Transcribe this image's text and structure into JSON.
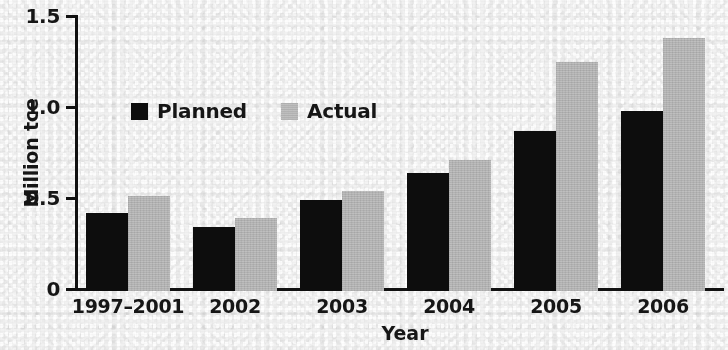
{
  "chart_data": {
    "type": "bar",
    "title": "",
    "xlabel": "Year",
    "ylabel": "Million tce",
    "ylim": [
      0,
      1.5
    ],
    "yticks": [
      0,
      0.5,
      1.0,
      1.5
    ],
    "ytick_labels": [
      "0",
      "0.5",
      "1.0",
      "1.5"
    ],
    "grid": false,
    "legend_position": "upper-left-inside",
    "categories": [
      "1997–2001",
      "2002",
      "2003",
      "2004",
      "2005",
      "2006"
    ],
    "series": [
      {
        "name": "Planned",
        "color": "#0d0d0d",
        "values": [
          0.43,
          0.35,
          0.5,
          0.65,
          0.88,
          0.99
        ]
      },
      {
        "name": "Actual",
        "color": "#b9b9b9",
        "values": [
          0.52,
          0.4,
          0.55,
          0.72,
          1.26,
          1.39
        ]
      }
    ]
  },
  "axes": {
    "y_title": "Million tce",
    "x_title": "Year",
    "y_tick_0": "0",
    "y_tick_1": "0.5",
    "y_tick_2": "1.0",
    "y_tick_3": "1.5"
  },
  "legend": {
    "entries": [
      {
        "label": "Planned",
        "swatch": "black-square-icon"
      },
      {
        "label": "Actual",
        "swatch": "gray-square-icon"
      }
    ]
  },
  "categories": {
    "c0": "1997–2001",
    "c1": "2002",
    "c2": "2003",
    "c3": "2004",
    "c4": "2005",
    "c5": "2006"
  },
  "colors": {
    "planned": "#0d0d0d",
    "actual": "#b9b9b9",
    "axis": "#111111",
    "background": "#f1f1f1"
  }
}
